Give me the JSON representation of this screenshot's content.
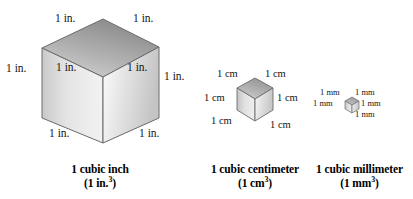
{
  "figure": {
    "background_color": "#ffffff",
    "text_color": "#141414"
  },
  "cubes": [
    {
      "id": "cubic-inch",
      "unit": "in.",
      "edge_label": "1 in.",
      "caption_line1": "1 cubic inch",
      "caption_line2_prefix": "(1 in.",
      "caption_line2_exponent": "3",
      "caption_line2_suffix": ")",
      "labels": [
        "1 in.",
        "1 in.",
        "1 in.",
        "1 in.",
        "1 in.",
        "1 in.",
        "1 in.",
        "1 in."
      ],
      "colors": {
        "top_face_light": "#d8d8d8",
        "top_face_dark": "#8f8f8f",
        "left_face_light": "#eeeeee",
        "left_face_dark": "#c2c2c2",
        "right_face_light": "#fbfbfb",
        "right_face_dark": "#c8c8c8",
        "edge": "#6b6b6b"
      }
    },
    {
      "id": "cubic-centimeter",
      "unit": "cm",
      "edge_label": "1 cm",
      "caption_line1": "1 cubic centimeter",
      "caption_line2_prefix": "(1 cm",
      "caption_line2_exponent": "3",
      "caption_line2_suffix": ")",
      "labels": [
        "1 cm",
        "1 cm",
        "1 cm",
        "1 cm",
        "1 cm",
        "1 cm"
      ],
      "colors": {
        "top_face_light": "#d6d6d6",
        "top_face_dark": "#9a9a9a",
        "left_face_light": "#ececec",
        "left_face_dark": "#bdbdbd",
        "right_face_light": "#f7f7f7",
        "right_face_dark": "#c9c9c9",
        "edge": "#6b6b6b"
      }
    },
    {
      "id": "cubic-millimeter",
      "unit": "mm",
      "edge_label": "1 mm",
      "caption_line1": "1 cubic millimeter",
      "caption_line2_prefix": "(1 mm",
      "caption_line2_exponent": "3",
      "caption_line2_suffix": ")",
      "labels": [
        "1 mm",
        "1 mm",
        "1 mm",
        "1 mm",
        "1 mm"
      ],
      "colors": {
        "top_face_light": "#d2d2d2",
        "top_face_dark": "#a0a0a0",
        "left_face_light": "#e8e8e8",
        "left_face_dark": "#bcbcbc",
        "right_face_light": "#f4f4f4",
        "right_face_dark": "#cacaca",
        "edge": "#6f6f6f"
      }
    }
  ]
}
